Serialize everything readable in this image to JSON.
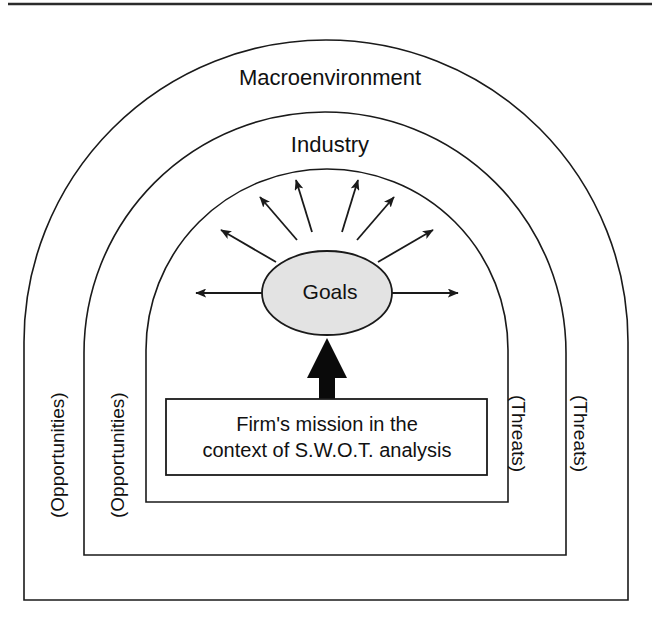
{
  "diagram": {
    "title_text_top": "Macroenvironment",
    "title_text_mid": "Industry",
    "center_node_label": "Goals",
    "mission_box": {
      "line1": "Firm's mission in the",
      "line2": "context of S.W.O.T. analysis"
    },
    "side_labels": {
      "left_outer": "(Opportunities)",
      "left_inner": "(Opportunities)",
      "right_inner": "(Threats)",
      "right_outer": "(Threats)"
    },
    "colors": {
      "stroke": "#1a1a1a",
      "goals_fill": "#e3e3e3",
      "background": "#ffffff",
      "thick_arrow": "#0a0a0a"
    },
    "layers": [
      {
        "name": "macroenvironment-arch",
        "order": 1
      },
      {
        "name": "industry-arch",
        "order": 2
      },
      {
        "name": "goals-arch",
        "order": 3
      },
      {
        "name": "mission-arch",
        "order": 4
      }
    ],
    "radiating_arrow_count": 8
  }
}
